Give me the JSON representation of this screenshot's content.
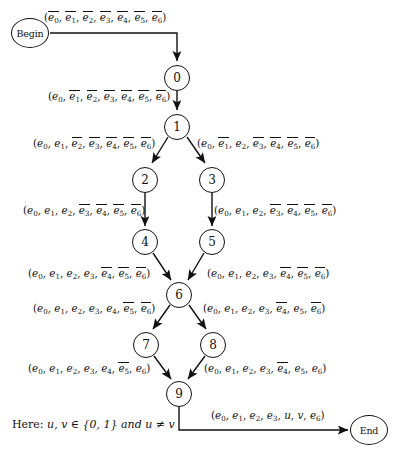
{
  "diagram": {
    "type": "state-transition-flowchart",
    "nodes": [
      {
        "id": "begin",
        "label": "Begin",
        "shape": "ellipse",
        "x": 30,
        "y": 33
      },
      {
        "id": "n0",
        "label": "0",
        "shape": "circle",
        "x": 177,
        "y": 78
      },
      {
        "id": "n1",
        "label": "1",
        "shape": "circle",
        "x": 177,
        "y": 127
      },
      {
        "id": "n2",
        "label": "2",
        "shape": "circle",
        "x": 145,
        "y": 180
      },
      {
        "id": "n3",
        "label": "3",
        "shape": "circle",
        "x": 212,
        "y": 180
      },
      {
        "id": "n4",
        "label": "4",
        "shape": "circle",
        "x": 145,
        "y": 242
      },
      {
        "id": "n5",
        "label": "5",
        "shape": "circle",
        "x": 212,
        "y": 242
      },
      {
        "id": "n6",
        "label": "6",
        "shape": "circle",
        "x": 179,
        "y": 295
      },
      {
        "id": "n7",
        "label": "7",
        "shape": "circle",
        "x": 146,
        "y": 345
      },
      {
        "id": "n8",
        "label": "8",
        "shape": "circle",
        "x": 213,
        "y": 345
      },
      {
        "id": "n9",
        "label": "9",
        "shape": "circle",
        "x": 179,
        "y": 394
      },
      {
        "id": "end",
        "label": "End",
        "shape": "ellipse",
        "x": 369,
        "y": 430
      }
    ],
    "edges": [
      {
        "id": "begin-0",
        "from": "begin",
        "to": "n0",
        "label_text": "(e̅0, e̅1, e̅2, e̅3, e̅4, e̅5, e̅6)",
        "terms": [
          {
            "sym": "e",
            "idx": "0",
            "bar": true
          },
          {
            "sym": "e",
            "idx": "1",
            "bar": true
          },
          {
            "sym": "e",
            "idx": "2",
            "bar": true
          },
          {
            "sym": "e",
            "idx": "3",
            "bar": true
          },
          {
            "sym": "e",
            "idx": "4",
            "bar": true
          },
          {
            "sym": "e",
            "idx": "5",
            "bar": true
          },
          {
            "sym": "e",
            "idx": "6",
            "bar": true
          }
        ]
      },
      {
        "id": "0-1",
        "from": "n0",
        "to": "n1",
        "label_text": "(e0, e̅1, e̅2, e̅3, e̅4, e̅5, e̅6)",
        "terms": [
          {
            "sym": "e",
            "idx": "0",
            "bar": false
          },
          {
            "sym": "e",
            "idx": "1",
            "bar": true
          },
          {
            "sym": "e",
            "idx": "2",
            "bar": true
          },
          {
            "sym": "e",
            "idx": "3",
            "bar": true
          },
          {
            "sym": "e",
            "idx": "4",
            "bar": true
          },
          {
            "sym": "e",
            "idx": "5",
            "bar": true
          },
          {
            "sym": "e",
            "idx": "6",
            "bar": true
          }
        ]
      },
      {
        "id": "1-2",
        "from": "n1",
        "to": "n2",
        "label_text": "(e0, e1, e̅2, e̅3, e̅4, e̅5, e̅6)",
        "terms": [
          {
            "sym": "e",
            "idx": "0",
            "bar": false
          },
          {
            "sym": "e",
            "idx": "1",
            "bar": false
          },
          {
            "sym": "e",
            "idx": "2",
            "bar": true
          },
          {
            "sym": "e",
            "idx": "3",
            "bar": true
          },
          {
            "sym": "e",
            "idx": "4",
            "bar": true
          },
          {
            "sym": "e",
            "idx": "5",
            "bar": true
          },
          {
            "sym": "e",
            "idx": "6",
            "bar": true
          }
        ]
      },
      {
        "id": "1-3",
        "from": "n1",
        "to": "n3",
        "label_text": "(e0, e̅1, e2, e̅3, e̅4, e̅5, e̅6)",
        "terms": [
          {
            "sym": "e",
            "idx": "0",
            "bar": false
          },
          {
            "sym": "e",
            "idx": "1",
            "bar": true
          },
          {
            "sym": "e",
            "idx": "2",
            "bar": false
          },
          {
            "sym": "e",
            "idx": "3",
            "bar": true
          },
          {
            "sym": "e",
            "idx": "4",
            "bar": true
          },
          {
            "sym": "e",
            "idx": "5",
            "bar": true
          },
          {
            "sym": "e",
            "idx": "6",
            "bar": true
          }
        ]
      },
      {
        "id": "2-4",
        "from": "n2",
        "to": "n4",
        "label_text": "(e0, e1, e2, e̅3, e̅4, e̅5, e̅6)",
        "terms": [
          {
            "sym": "e",
            "idx": "0",
            "bar": false
          },
          {
            "sym": "e",
            "idx": "1",
            "bar": false
          },
          {
            "sym": "e",
            "idx": "2",
            "bar": false
          },
          {
            "sym": "e",
            "idx": "3",
            "bar": true
          },
          {
            "sym": "e",
            "idx": "4",
            "bar": true
          },
          {
            "sym": "e",
            "idx": "5",
            "bar": true
          },
          {
            "sym": "e",
            "idx": "6",
            "bar": true
          }
        ]
      },
      {
        "id": "3-5",
        "from": "n3",
        "to": "n5",
        "label_text": "(e0, e1, e2, e̅3, e̅4, e̅5, e̅6)",
        "terms": [
          {
            "sym": "e",
            "idx": "0",
            "bar": false
          },
          {
            "sym": "e",
            "idx": "1",
            "bar": false
          },
          {
            "sym": "e",
            "idx": "2",
            "bar": false
          },
          {
            "sym": "e",
            "idx": "3",
            "bar": true
          },
          {
            "sym": "e",
            "idx": "4",
            "bar": true
          },
          {
            "sym": "e",
            "idx": "5",
            "bar": true
          },
          {
            "sym": "e",
            "idx": "6",
            "bar": true
          }
        ]
      },
      {
        "id": "4-6",
        "from": "n4",
        "to": "n6",
        "label_text": "(e0, e1, e2, e3, e̅4, e̅5, e̅6)",
        "terms": [
          {
            "sym": "e",
            "idx": "0",
            "bar": false
          },
          {
            "sym": "e",
            "idx": "1",
            "bar": false
          },
          {
            "sym": "e",
            "idx": "2",
            "bar": false
          },
          {
            "sym": "e",
            "idx": "3",
            "bar": false
          },
          {
            "sym": "e",
            "idx": "4",
            "bar": true
          },
          {
            "sym": "e",
            "idx": "5",
            "bar": true
          },
          {
            "sym": "e",
            "idx": "6",
            "bar": true
          }
        ]
      },
      {
        "id": "5-6",
        "from": "n5",
        "to": "n6",
        "label_text": "(e0, e1, e2, e3, e̅4, e̅5, e̅6)",
        "terms": [
          {
            "sym": "e",
            "idx": "0",
            "bar": false
          },
          {
            "sym": "e",
            "idx": "1",
            "bar": false
          },
          {
            "sym": "e",
            "idx": "2",
            "bar": false
          },
          {
            "sym": "e",
            "idx": "3",
            "bar": false
          },
          {
            "sym": "e",
            "idx": "4",
            "bar": true
          },
          {
            "sym": "e",
            "idx": "5",
            "bar": true
          },
          {
            "sym": "e",
            "idx": "6",
            "bar": true
          }
        ]
      },
      {
        "id": "6-7",
        "from": "n6",
        "to": "n7",
        "label_text": "(e0, e1, e2, e3, e4, e̅5, e̅6)",
        "terms": [
          {
            "sym": "e",
            "idx": "0",
            "bar": false
          },
          {
            "sym": "e",
            "idx": "1",
            "bar": false
          },
          {
            "sym": "e",
            "idx": "2",
            "bar": false
          },
          {
            "sym": "e",
            "idx": "3",
            "bar": false
          },
          {
            "sym": "e",
            "idx": "4",
            "bar": false
          },
          {
            "sym": "e",
            "idx": "5",
            "bar": true
          },
          {
            "sym": "e",
            "idx": "6",
            "bar": true
          }
        ]
      },
      {
        "id": "6-8",
        "from": "n6",
        "to": "n8",
        "label_text": "(e0, e1, e2, e3, e̅4, e5, e̅6)",
        "terms": [
          {
            "sym": "e",
            "idx": "0",
            "bar": false
          },
          {
            "sym": "e",
            "idx": "1",
            "bar": false
          },
          {
            "sym": "e",
            "idx": "2",
            "bar": false
          },
          {
            "sym": "e",
            "idx": "3",
            "bar": false
          },
          {
            "sym": "e",
            "idx": "4",
            "bar": true
          },
          {
            "sym": "e",
            "idx": "5",
            "bar": false
          },
          {
            "sym": "e",
            "idx": "6",
            "bar": true
          }
        ]
      },
      {
        "id": "7-9",
        "from": "n7",
        "to": "n9",
        "label_text": "(e0, e1, e2, e3, e4, e̅5, e6)",
        "terms": [
          {
            "sym": "e",
            "idx": "0",
            "bar": false
          },
          {
            "sym": "e",
            "idx": "1",
            "bar": false
          },
          {
            "sym": "e",
            "idx": "2",
            "bar": false
          },
          {
            "sym": "e",
            "idx": "3",
            "bar": false
          },
          {
            "sym": "e",
            "idx": "4",
            "bar": false
          },
          {
            "sym": "e",
            "idx": "5",
            "bar": true
          },
          {
            "sym": "e",
            "idx": "6",
            "bar": false
          }
        ]
      },
      {
        "id": "8-9",
        "from": "n8",
        "to": "n9",
        "label_text": "(e0, e1, e2, e3, e̅4, e5, e6)",
        "terms": [
          {
            "sym": "e",
            "idx": "0",
            "bar": false
          },
          {
            "sym": "e",
            "idx": "1",
            "bar": false
          },
          {
            "sym": "e",
            "idx": "2",
            "bar": false
          },
          {
            "sym": "e",
            "idx": "3",
            "bar": false
          },
          {
            "sym": "e",
            "idx": "4",
            "bar": true
          },
          {
            "sym": "e",
            "idx": "5",
            "bar": false
          },
          {
            "sym": "e",
            "idx": "6",
            "bar": false
          }
        ]
      },
      {
        "id": "9-end",
        "from": "n9",
        "to": "end",
        "label_text": "(e0, e1, e2, e3, u, v, e6)",
        "terms": [
          {
            "sym": "e",
            "idx": "0",
            "bar": false
          },
          {
            "sym": "e",
            "idx": "1",
            "bar": false
          },
          {
            "sym": "e",
            "idx": "2",
            "bar": false
          },
          {
            "sym": "e",
            "idx": "3",
            "bar": false
          },
          {
            "sym": "u",
            "idx": "",
            "bar": false
          },
          {
            "sym": "v",
            "idx": "",
            "bar": false
          },
          {
            "sym": "e",
            "idx": "6",
            "bar": false
          }
        ]
      }
    ],
    "note": {
      "prefix": "Here:",
      "body": "u, v ∈ {0, 1}  and  u ≠ v"
    },
    "colors": {
      "ink": "#111111",
      "background": "#ffffff"
    }
  }
}
